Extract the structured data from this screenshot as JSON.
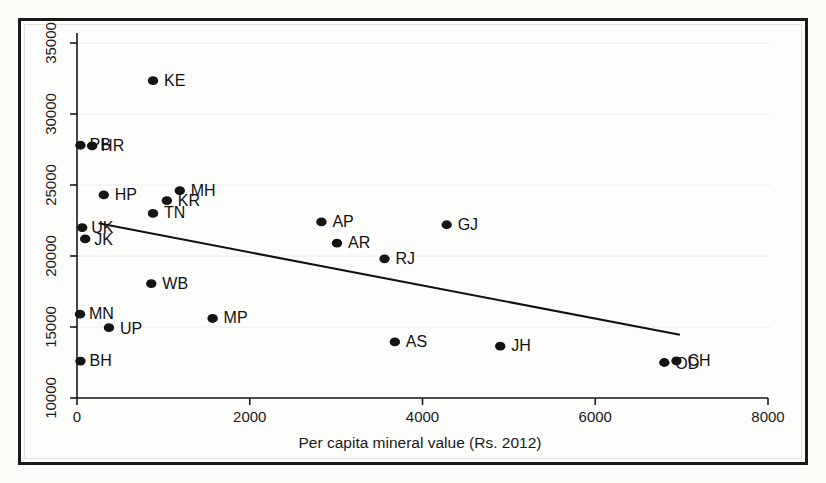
{
  "chart_data": {
    "type": "scatter",
    "title": "",
    "subtitle": "",
    "xlabel": "Per capita mineral value (Rs. 2012)",
    "ylabel": "",
    "xlim": [
      0,
      8000
    ],
    "ylim": [
      10000,
      35000
    ],
    "xticks": [
      0,
      2000,
      4000,
      6000,
      8000
    ],
    "xtick_labels": [
      "0",
      "2000",
      "4000",
      "6000",
      "8000"
    ],
    "yticks": [
      10000,
      15000,
      20000,
      25000,
      30000,
      35000
    ],
    "ytick_labels": [
      "10000",
      "15000",
      "20000",
      "25000",
      "30000",
      "35000"
    ],
    "grid": "horizontal",
    "legend": "none",
    "marker_color": "#141414",
    "fitline_color": "#121212",
    "points": [
      {
        "label": "KE",
        "x": 880,
        "y": 32350,
        "label_dx": 11,
        "label_dy": 5
      },
      {
        "label": "PB",
        "x": 40,
        "y": 27800,
        "label_dx": 9,
        "label_dy": 5
      },
      {
        "label": "HR",
        "x": 175,
        "y": 27750,
        "label_dx": 9,
        "label_dy": 5
      },
      {
        "label": "HP",
        "x": 310,
        "y": 24300,
        "label_dx": 11,
        "label_dy": 5
      },
      {
        "label": "MH",
        "x": 1190,
        "y": 24600,
        "label_dx": 11,
        "label_dy": 5
      },
      {
        "label": "KR",
        "x": 1040,
        "y": 23900,
        "label_dx": 11,
        "label_dy": 5
      },
      {
        "label": "TN",
        "x": 880,
        "y": 23000,
        "label_dx": 11,
        "label_dy": 5
      },
      {
        "label": "UK",
        "x": 60,
        "y": 22000,
        "label_dx": 9,
        "label_dy": 5
      },
      {
        "label": "JK",
        "x": 95,
        "y": 21200,
        "label_dx": 9,
        "label_dy": 6
      },
      {
        "label": "AP",
        "x": 2830,
        "y": 22400,
        "label_dx": 11,
        "label_dy": 5
      },
      {
        "label": "GJ",
        "x": 4280,
        "y": 22200,
        "label_dx": 11,
        "label_dy": 5
      },
      {
        "label": "AR",
        "x": 3010,
        "y": 20900,
        "label_dx": 11,
        "label_dy": 5
      },
      {
        "label": "RJ",
        "x": 3560,
        "y": 19800,
        "label_dx": 11,
        "label_dy": 5
      },
      {
        "label": "WB",
        "x": 860,
        "y": 18050,
        "label_dx": 11,
        "label_dy": 5
      },
      {
        "label": "MN",
        "x": 35,
        "y": 15900,
        "label_dx": 9,
        "label_dy": 5
      },
      {
        "label": "MP",
        "x": 1570,
        "y": 15600,
        "label_dx": 11,
        "label_dy": 5
      },
      {
        "label": "UP",
        "x": 370,
        "y": 14950,
        "label_dx": 11,
        "label_dy": 6
      },
      {
        "label": "AS",
        "x": 3680,
        "y": 13950,
        "label_dx": 11,
        "label_dy": 5
      },
      {
        "label": "JH",
        "x": 4900,
        "y": 13650,
        "label_dx": 11,
        "label_dy": 5
      },
      {
        "label": "BH",
        "x": 40,
        "y": 12600,
        "label_dx": 9,
        "label_dy": 5
      },
      {
        "label": "OD",
        "x": 6800,
        "y": 12500,
        "label_dx": 11,
        "label_dy": 6
      },
      {
        "label": "CH",
        "x": 6940,
        "y": 12620,
        "label_dx": 11,
        "label_dy": 5
      }
    ],
    "fit_line": {
      "x0": 250,
      "y0": 22300,
      "x1": 6980,
      "y1": 14450
    }
  }
}
